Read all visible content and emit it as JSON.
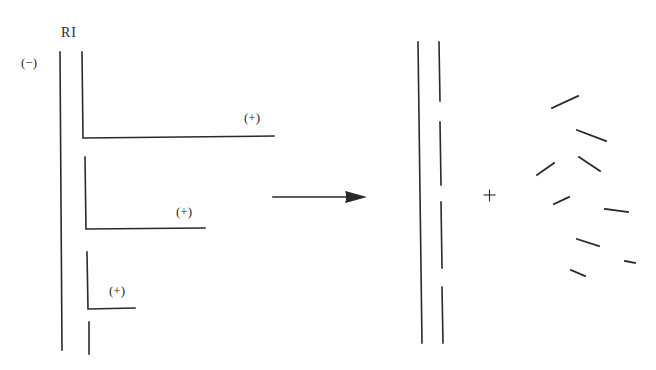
{
  "figure": {
    "left_panel": {
      "label_top": "RI",
      "label_left_strand": "(−)",
      "branches": [
        {
          "label": "(+)"
        },
        {
          "label": "(+)"
        },
        {
          "label": "(+)"
        }
      ]
    },
    "arrow": {
      "direction": "right"
    },
    "right_panel": {
      "plus_sign": "+",
      "fragments_count": 10
    },
    "colors": {
      "line": "#2a2a2a",
      "background": "#ffffff"
    }
  }
}
